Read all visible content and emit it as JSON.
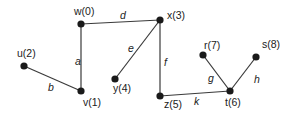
{
  "diagram": {
    "type": "graph",
    "nodes": [
      {
        "id": "w",
        "label": "w(0)",
        "x": 81,
        "y": 24,
        "lx": 74,
        "ly": 15
      },
      {
        "id": "x",
        "label": "x(3)",
        "x": 160,
        "y": 20,
        "lx": 167,
        "ly": 19
      },
      {
        "id": "u",
        "label": "u(2)",
        "x": 24,
        "y": 66,
        "lx": 17,
        "ly": 57
      },
      {
        "id": "v",
        "label": "v(1)",
        "x": 81,
        "y": 91,
        "lx": 83,
        "ly": 106
      },
      {
        "id": "y",
        "label": "y(4)",
        "x": 115,
        "y": 79,
        "lx": 113,
        "ly": 92
      },
      {
        "id": "z",
        "label": "z(5)",
        "x": 160,
        "y": 96,
        "lx": 164,
        "ly": 108
      },
      {
        "id": "t",
        "label": "t(6)",
        "x": 230,
        "y": 91,
        "lx": 225,
        "ly": 106
      },
      {
        "id": "r",
        "label": "r(7)",
        "x": 203,
        "y": 55,
        "lx": 204,
        "ly": 49
      },
      {
        "id": "s",
        "label": "s(8)",
        "x": 256,
        "y": 57,
        "lx": 262,
        "ly": 48
      }
    ],
    "edges": [
      {
        "id": "a",
        "label": "a",
        "from": "w",
        "to": "v",
        "lx": 75,
        "ly": 65
      },
      {
        "id": "b",
        "label": "b",
        "from": "u",
        "to": "v",
        "lx": 48,
        "ly": 91
      },
      {
        "id": "d",
        "label": "d",
        "from": "w",
        "to": "x",
        "lx": 120,
        "ly": 19
      },
      {
        "id": "e",
        "label": "e",
        "from": "x",
        "to": "y",
        "lx": 128,
        "ly": 52
      },
      {
        "id": "f",
        "label": "f",
        "from": "x",
        "to": "z",
        "lx": 164,
        "ly": 66
      },
      {
        "id": "g",
        "label": "g",
        "from": "r",
        "to": "t",
        "lx": 208,
        "ly": 82
      },
      {
        "id": "h",
        "label": "h",
        "from": "s",
        "to": "t",
        "lx": 254,
        "ly": 83
      },
      {
        "id": "k",
        "label": "k",
        "from": "z",
        "to": "t",
        "lx": 194,
        "ly": 105
      }
    ]
  }
}
